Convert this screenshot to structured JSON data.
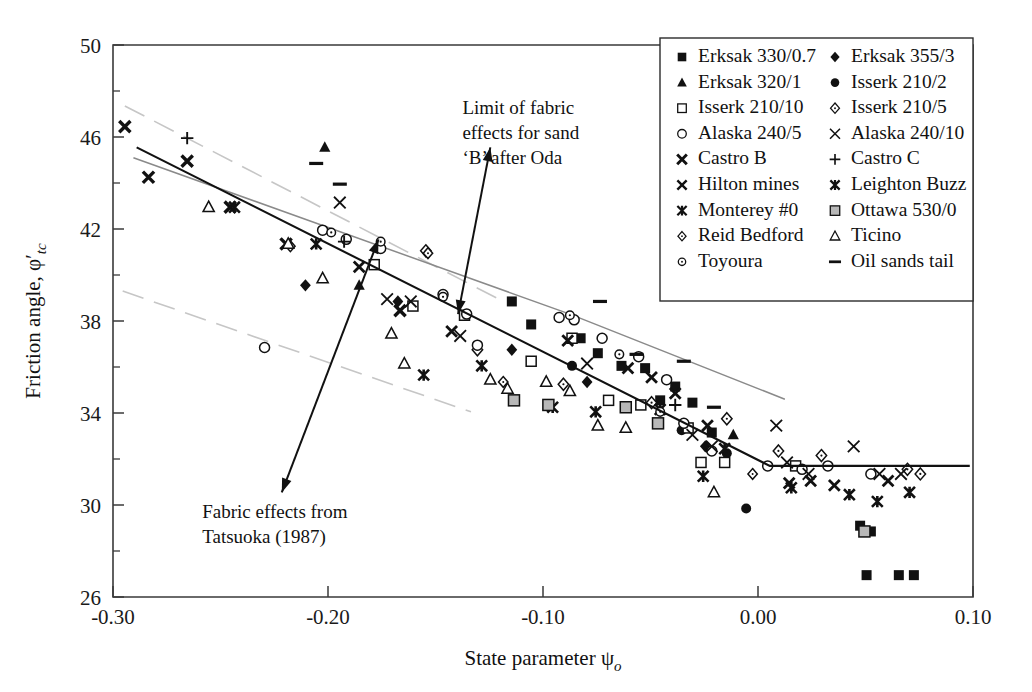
{
  "chart_data": {
    "type": "scatter",
    "title": "",
    "xlabel": "State parameter ψo",
    "ylabel": "Friction angle, φ'tc",
    "xlim": [
      -0.3,
      0.1
    ],
    "ylim": [
      26,
      50
    ],
    "xticks": [
      "-0.30",
      "-0.20",
      "-0.10",
      "0.00",
      "0.10"
    ],
    "xtick_values": [
      -0.3,
      -0.2,
      -0.1,
      0.0,
      0.1
    ],
    "yticks": [
      "26",
      "30",
      "34",
      "38",
      "42",
      "46",
      "50"
    ],
    "ytick_values": [
      26,
      30,
      34,
      38,
      42,
      46,
      50
    ],
    "grid": false,
    "legend_position": "top-right",
    "annotations": [
      {
        "id": "oda",
        "text_lines": [
          "Limit of fabric",
          "effects for sand",
          "‘B’ after Oda"
        ],
        "text_x": -0.1375,
        "text_y": 47.0,
        "arrow_from": [
          -0.1245,
          45.55
        ],
        "arrow_to": [
          -0.1395,
          38.3
        ]
      },
      {
        "id": "tatsuoka",
        "text_lines": [
          "Fabric effects from",
          "Tatsuoka (1987)"
        ],
        "text_x": -0.2585,
        "text_y": 29.45,
        "arrow_from": [
          -0.2215,
          30.55
        ],
        "arrow_to": [
          -0.1765,
          41.55
        ]
      }
    ],
    "lines": [
      {
        "name": "main-trend",
        "style": "solid-black",
        "points": [
          [
            -0.289,
            45.55
          ],
          [
            0.0055,
            31.7
          ],
          [
            0.0985,
            31.7
          ]
        ]
      },
      {
        "name": "oda-limit",
        "style": "solid-gray",
        "points": [
          [
            -0.2905,
            45.1
          ],
          [
            -0.0875,
            38.3
          ],
          [
            0.0125,
            34.6
          ]
        ]
      },
      {
        "name": "tatsuoka-upper",
        "style": "dashed-gray",
        "points": [
          [
            -0.2945,
            47.35
          ],
          [
            -0.1195,
            38.9
          ]
        ]
      },
      {
        "name": "tatsuoka-lower",
        "style": "dashed-gray",
        "points": [
          [
            -0.2955,
            39.3
          ],
          [
            -0.1335,
            34.05
          ]
        ]
      }
    ],
    "series": [
      {
        "name": "Erksak 330/0.7",
        "marker": "filled-square",
        "points": [
          [
            -0.1145,
            38.85
          ],
          [
            -0.1055,
            37.85
          ],
          [
            -0.0825,
            37.25
          ],
          [
            -0.0745,
            36.6
          ],
          [
            -0.0635,
            36.05
          ],
          [
            -0.0525,
            35.95
          ],
          [
            -0.0455,
            34.55
          ],
          [
            -0.0385,
            35.15
          ],
          [
            -0.0305,
            34.45
          ],
          [
            -0.0215,
            33.15
          ],
          [
            0.0475,
            29.1
          ],
          [
            0.0525,
            28.85
          ],
          [
            0.0505,
            26.95
          ],
          [
            0.0655,
            26.95
          ],
          [
            0.0725,
            26.95
          ]
        ]
      },
      {
        "name": "Erksak 355/3",
        "marker": "filled-diamond",
        "points": [
          [
            -0.2105,
            39.55
          ],
          [
            -0.1675,
            38.85
          ],
          [
            -0.1145,
            36.75
          ],
          [
            -0.0795,
            35.35
          ],
          [
            -0.0245,
            32.55
          ]
        ]
      },
      {
        "name": "Erksak 320/1",
        "marker": "filled-triangle",
        "points": [
          [
            -0.2015,
            45.55
          ],
          [
            -0.1855,
            39.55
          ],
          [
            -0.0115,
            33.05
          ]
        ]
      },
      {
        "name": "Isserk 210/2",
        "marker": "filled-circle",
        "points": [
          [
            -0.0865,
            36.05
          ],
          [
            -0.0355,
            33.25
          ],
          [
            -0.0145,
            32.25
          ],
          [
            -0.0055,
            29.85
          ]
        ]
      },
      {
        "name": "Isserk 210/10",
        "marker": "open-square",
        "points": [
          [
            -0.1785,
            40.45
          ],
          [
            -0.1605,
            38.65
          ],
          [
            -0.1365,
            38.25
          ],
          [
            -0.1055,
            36.25
          ],
          [
            -0.0865,
            37.25
          ],
          [
            -0.0695,
            34.55
          ],
          [
            -0.0545,
            34.35
          ],
          [
            -0.0325,
            33.35
          ],
          [
            -0.0265,
            31.85
          ],
          [
            -0.0155,
            31.85
          ],
          [
            0.0175,
            31.7
          ]
        ]
      },
      {
        "name": "Isserk 210/5",
        "marker": "open-diamond",
        "points": [
          [
            -0.1545,
            41.05
          ],
          [
            -0.1305,
            36.75
          ],
          [
            -0.0905,
            35.25
          ],
          [
            -0.0495,
            34.45
          ],
          [
            -0.0145,
            33.75
          ],
          [
            0.0095,
            32.35
          ],
          [
            0.0295,
            32.15
          ],
          [
            0.0695,
            31.55
          ],
          [
            0.0755,
            31.35
          ]
        ]
      },
      {
        "name": "Alaska 240/5",
        "marker": "open-circle",
        "points": [
          [
            -0.2295,
            36.85
          ],
          [
            -0.2025,
            41.95
          ],
          [
            -0.1915,
            41.55
          ],
          [
            -0.1755,
            41.15
          ],
          [
            -0.1465,
            39.15
          ],
          [
            -0.1355,
            38.3
          ],
          [
            -0.1305,
            36.95
          ],
          [
            -0.0925,
            38.15
          ],
          [
            -0.0855,
            38.05
          ],
          [
            -0.0725,
            37.25
          ],
          [
            -0.0555,
            36.45
          ],
          [
            -0.0425,
            35.45
          ],
          [
            -0.0345,
            33.55
          ],
          [
            -0.0215,
            32.35
          ],
          [
            0.0045,
            31.7
          ],
          [
            0.0205,
            31.55
          ],
          [
            0.0325,
            31.7
          ],
          [
            0.0525,
            31.35
          ]
        ]
      },
      {
        "name": "Alaska 240/10",
        "marker": "x-thin",
        "points": [
          [
            -0.1945,
            43.15
          ],
          [
            -0.1725,
            38.95
          ],
          [
            -0.1615,
            38.85
          ],
          [
            -0.1385,
            37.35
          ],
          [
            -0.0795,
            36.15
          ],
          [
            -0.0305,
            33.05
          ],
          [
            -0.0215,
            32.55
          ],
          [
            0.0085,
            33.45
          ],
          [
            0.0135,
            31.85
          ],
          [
            0.0235,
            31.35
          ],
          [
            0.0445,
            32.55
          ],
          [
            0.0565,
            31.35
          ],
          [
            0.0665,
            31.35
          ]
        ]
      },
      {
        "name": "Castro B",
        "marker": "x-bold",
        "points": [
          [
            -0.2945,
            46.45
          ],
          [
            -0.2835,
            44.25
          ],
          [
            -0.2655,
            44.95
          ],
          [
            -0.2455,
            42.95
          ],
          [
            -0.2195,
            41.35
          ],
          [
            -0.1665,
            38.45
          ]
        ]
      },
      {
        "name": "Castro C",
        "marker": "plus",
        "points": [
          [
            -0.2655,
            45.95
          ],
          [
            -0.1925,
            41.45
          ],
          [
            -0.0385,
            34.35
          ]
        ]
      },
      {
        "name": "Hilton mines",
        "marker": "x-bold2",
        "points": [
          [
            -0.1855,
            40.35
          ],
          [
            -0.1425,
            37.55
          ],
          [
            -0.0885,
            37.15
          ],
          [
            -0.0605,
            35.95
          ],
          [
            -0.0495,
            35.55
          ],
          [
            -0.0385,
            34.85
          ],
          [
            -0.0235,
            33.45
          ],
          [
            0.0145,
            30.95
          ],
          [
            0.0245,
            31.05
          ],
          [
            0.0355,
            30.85
          ],
          [
            0.0605,
            31.05
          ]
        ]
      },
      {
        "name": "Leighton Buzz",
        "marker": "star-bold",
        "points": [
          [
            -0.2055,
            41.35
          ],
          [
            -0.1555,
            35.65
          ],
          [
            -0.0955,
            34.25
          ],
          [
            -0.0755,
            34.05
          ],
          [
            -0.0455,
            34.15
          ],
          [
            -0.0255,
            31.25
          ],
          [
            0.0155,
            30.75
          ],
          [
            0.0425,
            30.45
          ],
          [
            0.0555,
            30.15
          ],
          [
            0.0705,
            30.55
          ]
        ]
      },
      {
        "name": "Monterey #0",
        "marker": "star-bold",
        "points": [
          [
            -0.2435,
            42.95
          ],
          [
            -0.1285,
            36.05
          ],
          [
            -0.0155,
            32.45
          ]
        ]
      },
      {
        "name": "Ottawa 530/0",
        "marker": "shaded-square",
        "points": [
          [
            -0.1135,
            34.55
          ],
          [
            -0.0975,
            34.35
          ],
          [
            -0.0615,
            34.25
          ],
          [
            -0.0465,
            33.55
          ],
          [
            0.0495,
            28.85
          ]
        ]
      },
      {
        "name": "Reid Bedford",
        "marker": "open-diamond-sm",
        "points": [
          [
            -0.2175,
            41.25
          ],
          [
            -0.1535,
            40.95
          ],
          [
            -0.1185,
            35.35
          ],
          [
            -0.0025,
            31.35
          ]
        ]
      },
      {
        "name": "Ticino",
        "marker": "open-triangle",
        "points": [
          [
            -0.2555,
            42.95
          ],
          [
            -0.2185,
            41.35
          ],
          [
            -0.2025,
            39.85
          ],
          [
            -0.1705,
            37.45
          ],
          [
            -0.1645,
            36.15
          ],
          [
            -0.1245,
            35.45
          ],
          [
            -0.1165,
            35.05
          ],
          [
            -0.0985,
            35.35
          ],
          [
            -0.0875,
            34.95
          ],
          [
            -0.0745,
            33.45
          ],
          [
            -0.0615,
            33.35
          ],
          [
            -0.0205,
            30.55
          ]
        ]
      },
      {
        "name": "Toyoura",
        "marker": "open-circle-sm",
        "points": [
          [
            -0.1985,
            41.85
          ],
          [
            -0.1755,
            41.45
          ],
          [
            -0.1465,
            39.05
          ],
          [
            -0.0875,
            38.25
          ],
          [
            -0.0645,
            36.55
          ],
          [
            -0.0455,
            34.05
          ]
        ]
      },
      {
        "name": "Oil sands tail",
        "marker": "dash",
        "points": [
          [
            -0.2055,
            44.85
          ],
          [
            -0.1945,
            43.95
          ],
          [
            -0.0735,
            38.85
          ],
          [
            -0.0565,
            36.55
          ],
          [
            -0.0345,
            36.25
          ],
          [
            -0.0205,
            34.25
          ]
        ]
      }
    ]
  },
  "legend": {
    "columns": [
      [
        {
          "marker": "filled-square",
          "label": "Erksak 330/0.7"
        },
        {
          "marker": "filled-triangle",
          "label": "Erksak 320/1"
        },
        {
          "marker": "open-square",
          "label": "Isserk 210/10"
        },
        {
          "marker": "open-circle",
          "label": "Alaska 240/5"
        },
        {
          "marker": "x-bold",
          "label": "Castro B"
        },
        {
          "marker": "x-bold2",
          "label": "Hilton mines"
        },
        {
          "marker": "star-bold",
          "label": "Monterey #0"
        },
        {
          "marker": "open-diamond-sm",
          "label": "Reid Bedford"
        },
        {
          "marker": "open-circle-sm",
          "label": "Toyoura"
        }
      ],
      [
        {
          "marker": "filled-diamond",
          "label": "Erksak 355/3"
        },
        {
          "marker": "filled-circle",
          "label": "Isserk 210/2"
        },
        {
          "marker": "open-diamond",
          "label": "Isserk 210/5"
        },
        {
          "marker": "x-thin",
          "label": "Alaska 240/10"
        },
        {
          "marker": "plus",
          "label": "Castro C"
        },
        {
          "marker": "star-bold",
          "label": "Leighton Buzz"
        },
        {
          "marker": "shaded-square",
          "label": "Ottawa 530/0"
        },
        {
          "marker": "open-triangle",
          "label": "Ticino"
        },
        {
          "marker": "dash",
          "label": "Oil sands tail"
        }
      ]
    ]
  },
  "colors": {
    "ink": "#111111",
    "axis": "#3a3a3a",
    "gray_line": "#8a8a8a",
    "dash_line": "#c6c6c6",
    "shaded_fill": "#b8b8b8"
  }
}
